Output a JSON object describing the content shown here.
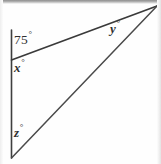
{
  "figure": {
    "canvas": {
      "width": 161,
      "height": 164
    },
    "background_color": "#fefefe",
    "stroke_color": "#3a3a3a",
    "label_color": "#2f2f2f",
    "degree_symbol": "°",
    "vertices": {
      "top_of_vertical": {
        "x": 11,
        "y": 30
      },
      "intersection": {
        "x": 11,
        "y": 60
      },
      "bottom": {
        "x": 11,
        "y": 158
      },
      "apex": {
        "x": 157,
        "y": 6
      }
    },
    "segments": [
      {
        "name": "vertical-line",
        "x1": 11,
        "y1": 30,
        "x2": 11,
        "y2": 158
      },
      {
        "name": "upper-transversal",
        "x1": 11,
        "y1": 60,
        "x2": 157,
        "y2": 6
      },
      {
        "name": "lower-side",
        "x1": 11,
        "y1": 158,
        "x2": 157,
        "y2": 6
      }
    ],
    "labels": [
      {
        "id": "angle-75",
        "value": "75",
        "degree": "°",
        "italic": false
      },
      {
        "id": "angle-x",
        "value": "x",
        "degree": "°",
        "italic": true
      },
      {
        "id": "angle-y",
        "value": "y",
        "degree": "°",
        "italic": true
      },
      {
        "id": "angle-z",
        "value": "z",
        "degree": "°",
        "italic": true
      }
    ]
  },
  "text": {
    "angle_75_value": "75",
    "angle_75_degree": "°",
    "angle_x_value": "x",
    "angle_x_degree": "°",
    "angle_y_value": "y",
    "angle_y_degree": "°",
    "angle_z_value": "z",
    "angle_z_degree": "°"
  }
}
